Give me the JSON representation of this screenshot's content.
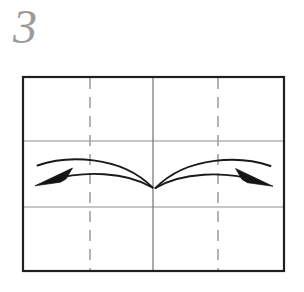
{
  "figure": {
    "kind": "origami-instruction-diagram",
    "step_number": "3",
    "step_number_color": "#9b9b9b",
    "background_color": "#ffffff"
  },
  "paper": {
    "shape_name": "paper-rectangle",
    "outline_color": "#1f1f1f",
    "outline_width": 2,
    "left": 22,
    "top": 76,
    "right": 285,
    "bottom": 272,
    "width": 263,
    "height": 196
  },
  "creases": {
    "solid_color": "#888888",
    "dashed_color": "#9a9a9a",
    "horizontal": [
      {
        "name": "upper-horizontal-crease",
        "y": 141,
        "style": "solid"
      },
      {
        "name": "lower-horizontal-crease",
        "y": 207,
        "style": "solid"
      }
    ],
    "vertical": [
      {
        "name": "left-dashed-crease",
        "x": 90,
        "style": "dashed"
      },
      {
        "name": "center-vertical-crease",
        "x": 153,
        "style": "solid"
      },
      {
        "name": "right-dashed-crease",
        "x": 218,
        "style": "solid-dashed"
      }
    ],
    "dash_pattern": "10 7"
  },
  "arrows": [
    {
      "name": "fold-arrow-left",
      "direction": "left",
      "color": "#1a1a1a",
      "tip_x": 36,
      "tip_y": 186,
      "tail_x": 152,
      "tail_y": 188,
      "apex_x": 96,
      "apex_y": 160
    },
    {
      "name": "fold-arrow-right",
      "direction": "right",
      "color": "#1a1a1a",
      "tip_x": 272,
      "tip_y": 187,
      "tail_x": 163,
      "tail_y": 188,
      "apex_x": 216,
      "apex_y": 160
    }
  ]
}
